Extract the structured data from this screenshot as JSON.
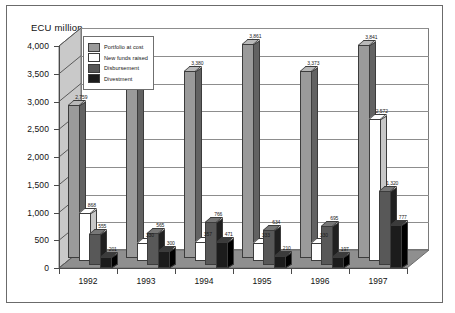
{
  "chart_data": {
    "type": "bar",
    "title": "",
    "ylabel": "ECU million",
    "xlabel": "",
    "ylim": [
      0,
      4000
    ],
    "yticks": [
      "0",
      "500",
      "1,000",
      "1,500",
      "2,000",
      "2,500",
      "3,000",
      "3,500",
      "4,000"
    ],
    "ytick_values": [
      0,
      500,
      1000,
      1500,
      2000,
      2500,
      3000,
      3500,
      4000
    ],
    "grid": true,
    "legend_position": "upper-left-inside",
    "categories": [
      "1992",
      "1993",
      "1994",
      "1995",
      "1996",
      "1997"
    ],
    "series": [
      {
        "name": "Portfolio at cost",
        "color": "#9a9a9a",
        "values": [
          2759,
          3106,
          3380,
          3861,
          3373,
          3841
        ],
        "labels": [
          "2,759",
          "3,106",
          "3,380",
          "3,861",
          "3,373",
          "3,841"
        ]
      },
      {
        "name": "New funds raised",
        "color": "#ffffff",
        "values": [
          868,
          330,
          357,
          333,
          330,
          2572
        ],
        "labels": [
          "868",
          "330",
          "357",
          "333",
          "330",
          "2,572"
        ]
      },
      {
        "name": "Disbursement",
        "color": "#585858",
        "values": [
          555,
          565,
          766,
          634,
          695,
          1320
        ],
        "labels": [
          "555",
          "565",
          "766",
          "634",
          "695",
          "1,320"
        ]
      },
      {
        "name": "Divestment",
        "color": "#1c1c1c",
        "values": [
          201,
          300,
          471,
          210,
          197,
          777
        ],
        "labels": [
          "201",
          "300",
          "471",
          "210",
          "197",
          "777"
        ]
      }
    ]
  },
  "legend": {
    "items": [
      {
        "label": "Portfolio at cost",
        "color": "#9a9a9a"
      },
      {
        "label": "New funds raised",
        "color": "#ffffff"
      },
      {
        "label": "Disbursement",
        "color": "#585858"
      },
      {
        "label": "Divestment",
        "color": "#1c1c1c"
      }
    ]
  },
  "colors": {
    "frame": "#6b6b6b",
    "gridline": "#8d8d8d",
    "floor": "#8f8f8f",
    "leftwall": "#c9c9c9",
    "axis": "#4a4a4a",
    "bar_outline": "#3c3c3c"
  }
}
